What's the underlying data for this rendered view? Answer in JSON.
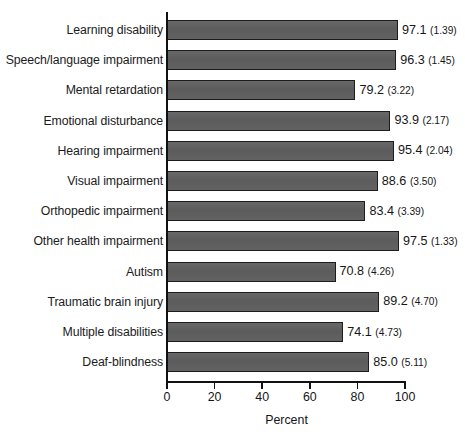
{
  "chart_data": {
    "type": "bar",
    "orientation": "horizontal",
    "title": "",
    "xlabel": "Percent",
    "ylabel": "",
    "xlim": [
      0,
      100
    ],
    "xticks": [
      0,
      20,
      40,
      60,
      80,
      100
    ],
    "xtick_labels": [
      "0",
      "20",
      "40",
      "60",
      "80",
      "100"
    ],
    "grid": false,
    "legend": null,
    "bar_color": "#5f5f5f",
    "bar_edge_color": "#1c1c1c",
    "value_label_format": "value (standard_error)",
    "categories": [
      "Learning disability",
      "Speech/language impairment",
      "Mental retardation",
      "Emotional disturbance",
      "Hearing impairment",
      "Visual impairment",
      "Orthopedic impairment",
      "Other health impairment",
      "Autism",
      "Traumatic brain injury",
      "Multiple disabilities",
      "Deaf-blindness"
    ],
    "values": [
      97.1,
      96.3,
      79.2,
      93.9,
      95.4,
      88.6,
      83.4,
      97.5,
      70.8,
      89.2,
      74.1,
      85.0
    ],
    "standard_errors": [
      1.39,
      1.45,
      3.22,
      2.17,
      2.04,
      3.5,
      3.39,
      1.33,
      4.26,
      4.7,
      4.73,
      5.11
    ],
    "value_labels": [
      "97.1",
      "96.3",
      "79.2",
      "93.9",
      "95.4",
      "88.6",
      "83.4",
      "97.5",
      "70.8",
      "89.2",
      "74.1",
      "85.0"
    ],
    "se_labels": [
      "(1.39)",
      "(1.45)",
      "(3.22)",
      "(2.17)",
      "(2.04)",
      "(3.50)",
      "(3.39)",
      "(1.33)",
      "(4.26)",
      "(4.70)",
      "(4.73)",
      "(5.11)"
    ]
  }
}
